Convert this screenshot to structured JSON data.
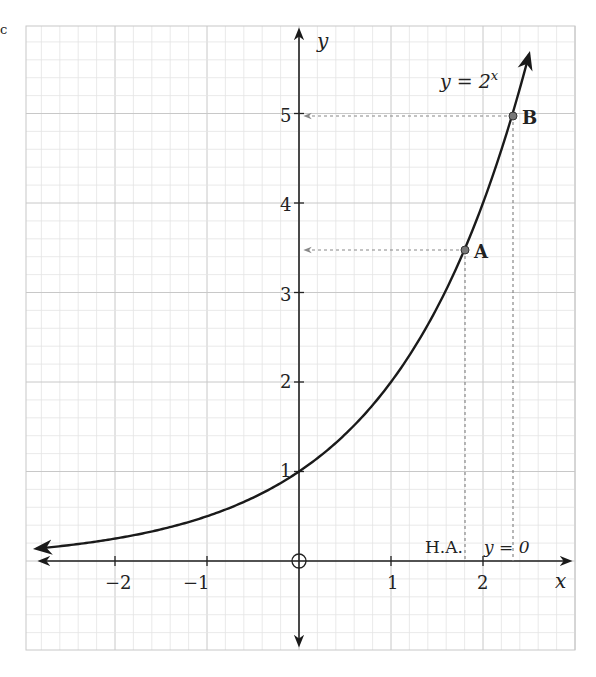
{
  "chart_data": {
    "type": "line",
    "title": "",
    "function_label": "y = 2^x",
    "function_label_base": "y = 2",
    "function_label_exp": "x",
    "xlabel": "x",
    "ylabel": "y",
    "xlim": [
      -2.9,
      3.0
    ],
    "ylim": [
      -0.95,
      5.95
    ],
    "grid": true,
    "grid_major": 1,
    "grid_minor": 0.2,
    "x_ticks": [
      -2,
      -1,
      1,
      2
    ],
    "x_tick_labels": [
      "−2",
      "−1",
      "1",
      "2"
    ],
    "y_ticks": [
      1,
      2,
      3,
      4,
      5
    ],
    "y_tick_labels": [
      "1",
      "2",
      "3",
      "4",
      "5"
    ],
    "series": [
      {
        "name": "y = 2^x",
        "x": [
          -2.85,
          -2.5,
          -2,
          -1.5,
          -1,
          -0.5,
          0,
          0.5,
          1,
          1.5,
          1.8,
          2,
          2.32,
          2.5
        ],
        "values": [
          0.14,
          0.18,
          0.25,
          0.35,
          0.5,
          0.71,
          1,
          1.41,
          2,
          2.83,
          3.48,
          4,
          5,
          5.66
        ]
      }
    ],
    "points": [
      {
        "label": "A",
        "x": 1.8,
        "y": 3.5
      },
      {
        "label": "B",
        "x": 2.32,
        "y": 5
      }
    ],
    "annotations": [
      {
        "text": "H.A.",
        "note": "horizontal asymptote"
      },
      {
        "text": "y = 0"
      }
    ],
    "origin_marker": "circle-cross"
  },
  "labels": {
    "corner_mark": "c",
    "x_axis": "x",
    "y_axis": "y",
    "func_base": "y = 2",
    "func_exp": "x",
    "point_a": "A",
    "point_b": "B",
    "ha": "H.A.",
    "ha_eq": "y = 0",
    "xt_m2": "−2",
    "xt_m1": "−1",
    "xt_1": "1",
    "xt_2": "2",
    "yt_1": "1",
    "yt_2": "2",
    "yt_3": "3",
    "yt_4": "4",
    "yt_5": "5"
  },
  "colors": {
    "grid_minor": "#e4e4e4",
    "grid_major": "#c8c8c8",
    "axis": "#222222",
    "curve": "#1a1a1a",
    "dashed": "#888888",
    "point_fill": "#777777"
  }
}
